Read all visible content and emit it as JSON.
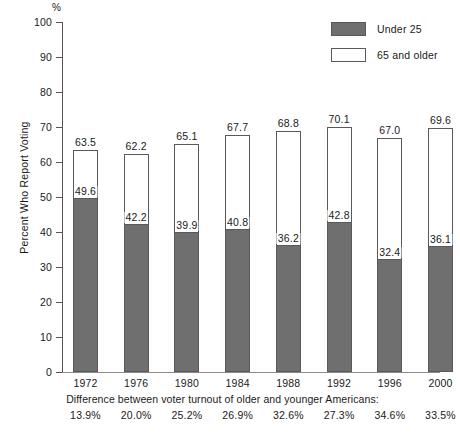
{
  "chart_data": {
    "type": "bar",
    "subtype": "overlapping-grouped",
    "title": "",
    "xlabel": "",
    "ylabel": "Percent Who Report Voting",
    "y_unit": "%",
    "ylim": [
      0,
      100
    ],
    "yticks": [
      0,
      10,
      20,
      30,
      40,
      50,
      60,
      70,
      80,
      90,
      100
    ],
    "ytick_labels": [
      "0",
      "10",
      "20",
      "30",
      "40",
      "50",
      "60",
      "70",
      "80",
      "90",
      "100"
    ],
    "grid": false,
    "legend_position": "top-right",
    "categories": [
      "1972",
      "1976",
      "1980",
      "1984",
      "1988",
      "1992",
      "1996",
      "2000"
    ],
    "series": [
      {
        "name": "65 and older",
        "color": "#ffffff",
        "values": [
          63.5,
          62.2,
          65.1,
          67.7,
          68.8,
          70.1,
          67.0,
          69.6
        ],
        "labels": [
          "63.5",
          "62.2",
          "65.1",
          "67.7",
          "68.8",
          "70.1",
          "67.0",
          "69.6"
        ]
      },
      {
        "name": "Under 25",
        "color": "#6f6f6f",
        "values": [
          49.6,
          42.2,
          39.9,
          40.8,
          36.2,
          42.8,
          32.4,
          36.1
        ],
        "labels": [
          "49.6",
          "42.2",
          "39.9",
          "40.8",
          "36.2",
          "42.8",
          "32.4",
          "36.1"
        ]
      }
    ],
    "annotations": {
      "footnote_title": "Difference between voter turnout of older and younger Americans:",
      "differences": [
        "13.9%",
        "20.0%",
        "25.2%",
        "26.9%",
        "32.6%",
        "27.3%",
        "34.6%",
        "33.5%"
      ]
    }
  },
  "legend": {
    "items": [
      {
        "label": "Under 25",
        "swatch": "filled-gray"
      },
      {
        "label": "65 and older",
        "swatch": "outline-white"
      }
    ]
  },
  "colors": {
    "bar_young": "#6f6f6f",
    "bar_old": "#ffffff",
    "bar_stroke": "#595959",
    "axis": "#555555",
    "text": "#1a1a1a",
    "background": "#ffffff"
  }
}
